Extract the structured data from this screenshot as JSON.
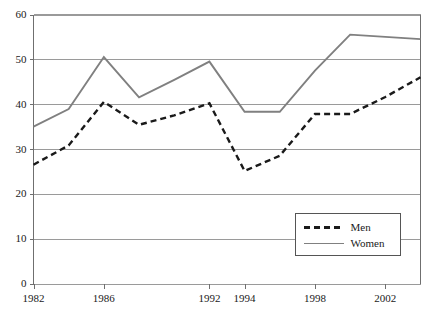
{
  "chart_data": {
    "type": "line",
    "title": "",
    "subtitle": "",
    "xlabel": "",
    "ylabel": "",
    "xlim": [
      1982,
      2004
    ],
    "ylim": [
      0,
      60
    ],
    "grid": true,
    "grid_axis": "y",
    "legend_position": "lower-right",
    "x": [
      1982,
      1984,
      1986,
      1988,
      1990,
      1992,
      1994,
      1996,
      1998,
      2000,
      2002,
      2004
    ],
    "x_tick_labels": [
      "1982",
      "1986",
      "1992",
      "1994",
      "1998",
      "2002"
    ],
    "x_tick_values": [
      1982,
      1986,
      1992,
      1994,
      1998,
      2002
    ],
    "y_tick_labels": [
      "0",
      "10",
      "20",
      "30",
      "40",
      "50",
      "60"
    ],
    "y_tick_values": [
      0,
      10,
      20,
      30,
      40,
      50,
      60
    ],
    "series": [
      {
        "name": "Men",
        "style": "dashed",
        "color": "#1a1a1a",
        "values": [
          26.5,
          30.8,
          40.5,
          35.4,
          37.5,
          40.2,
          25.1,
          28.5,
          37.8,
          37.8,
          41.6,
          46.0
        ]
      },
      {
        "name": "Women",
        "style": "solid",
        "color": "#808080",
        "values": [
          35.0,
          38.9,
          50.5,
          41.5,
          45.4,
          49.5,
          38.3,
          38.3,
          47.5,
          55.5,
          55.0,
          54.5
        ]
      }
    ]
  },
  "legend": {
    "entries": [
      {
        "label": "Men",
        "style": "dashed",
        "color": "#1a1a1a"
      },
      {
        "label": "Women",
        "style": "solid",
        "color": "#808080"
      }
    ]
  },
  "colors": {
    "men_line": "#1a1a1a",
    "women_line": "#808080",
    "grid": "#9a9a9a",
    "axis": "#6f6f6f",
    "background": "#ffffff"
  }
}
